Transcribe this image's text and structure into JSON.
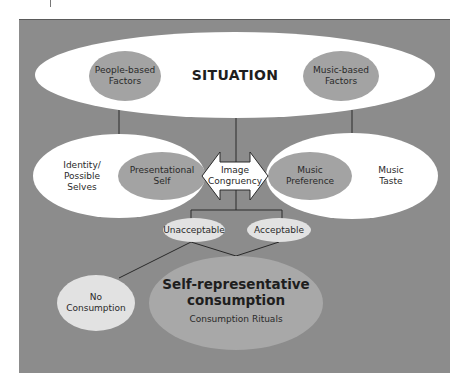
{
  "diagram": {
    "colors": {
      "background_panel": "#8c8c8c",
      "white_ellipse": "#ffffff",
      "grey_ellipse": "#a3a3a3",
      "light_ellipse": "#e2e2e2",
      "line": "#2a2a2a"
    },
    "situation": {
      "label": "SITUATION",
      "left_factor": "People-based\nFactors",
      "right_factor": "Music-based\nFactors"
    },
    "identity": {
      "outer_label": "Identity/\nPossible\nSelves",
      "inner_label": "Presentational\nSelf"
    },
    "music": {
      "inner_label": "Music\nPreference",
      "outer_label": "Music\nTaste"
    },
    "arrow": {
      "label": "Image\nCongruency"
    },
    "outcomes": {
      "unacceptable": "Unacceptable",
      "acceptable": "Acceptable"
    },
    "results": {
      "no_consumption": "No\nConsumption",
      "self_rep_title": "Self-representative\nconsumption",
      "self_rep_sub": "Consumption Rituals"
    }
  }
}
